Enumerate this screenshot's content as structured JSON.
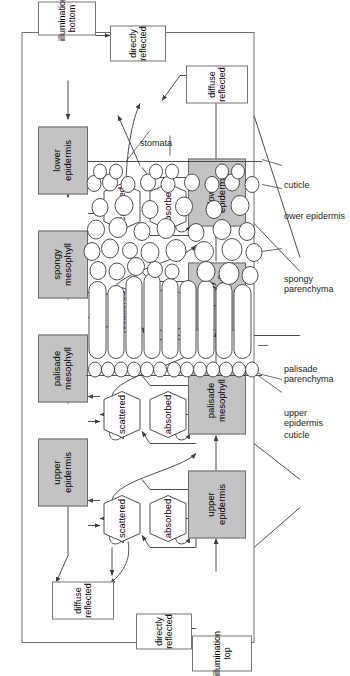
{
  "figure": {
    "colors": {
      "tissue_fill": "#c3c3c3",
      "tissue_stroke": "#6b6b6b",
      "box_stroke": "#747474",
      "line": "#4c4c4c",
      "cell_stroke": "#3a3a3a",
      "text": "#000000"
    }
  },
  "model": {
    "inputs": [
      {
        "id": "illumination-top",
        "label": "illumination\ntop"
      },
      {
        "id": "illumination-bottom",
        "label": "illumination\nbottom"
      }
    ],
    "outputs": [
      {
        "id": "directly-reflected-top",
        "label": "directly\nreflected"
      },
      {
        "id": "diffuse-reflected-top",
        "label": "diffuse\nreflected"
      },
      {
        "id": "directly-reflected-bottom",
        "label": "directly\nreflected"
      },
      {
        "id": "diffuse-reflected-bottom",
        "label": "diffuse\nreflected"
      }
    ],
    "bottom_row_tissues": [
      {
        "id": "upper-epidermis",
        "label": "upper\nepidermis"
      },
      {
        "id": "palisade-mesophyll",
        "label": "palisade\nmesophyll"
      },
      {
        "id": "spongy-mesophyll",
        "label": "spongy\nmesophyll"
      },
      {
        "id": "lower-epidermis",
        "label": "lower\nepidermis"
      }
    ],
    "top_row_tissues": [
      {
        "id": "upper-epidermis",
        "label": "upper\nepidermis"
      },
      {
        "id": "palisade-mesophyll",
        "label": "palisade\nmesophyll"
      },
      {
        "id": "spongy-mesophyll",
        "label": "spongy\nmesophyll"
      },
      {
        "id": "lower-epidermis",
        "label": "lower\nepidermis"
      }
    ],
    "absorbed_nodes": [
      {
        "label": "absorbed"
      },
      {
        "label": "absorbed"
      },
      {
        "label": "absorbed"
      },
      {
        "label": "absorbed"
      }
    ],
    "scattered_nodes": [
      {
        "label": "scattered"
      },
      {
        "label": "scattered"
      },
      {
        "label": "scattered"
      },
      {
        "label": "scattered"
      }
    ]
  },
  "leaf_section": {
    "labels": [
      {
        "id": "cuticle-upper",
        "label": "cuticle"
      },
      {
        "id": "upper-epidermis",
        "label": "upper\nepidermis"
      },
      {
        "id": "palisade-parenchyma",
        "label": "palisade\nparenchyma"
      },
      {
        "id": "spongy-parenchyma",
        "label": "spongy\nparenchyma"
      },
      {
        "id": "lower-epidermis",
        "label": "ower epidermis"
      },
      {
        "id": "cuticle-lower",
        "label": "cuticle"
      },
      {
        "id": "stomata",
        "label": "stomata"
      }
    ]
  }
}
